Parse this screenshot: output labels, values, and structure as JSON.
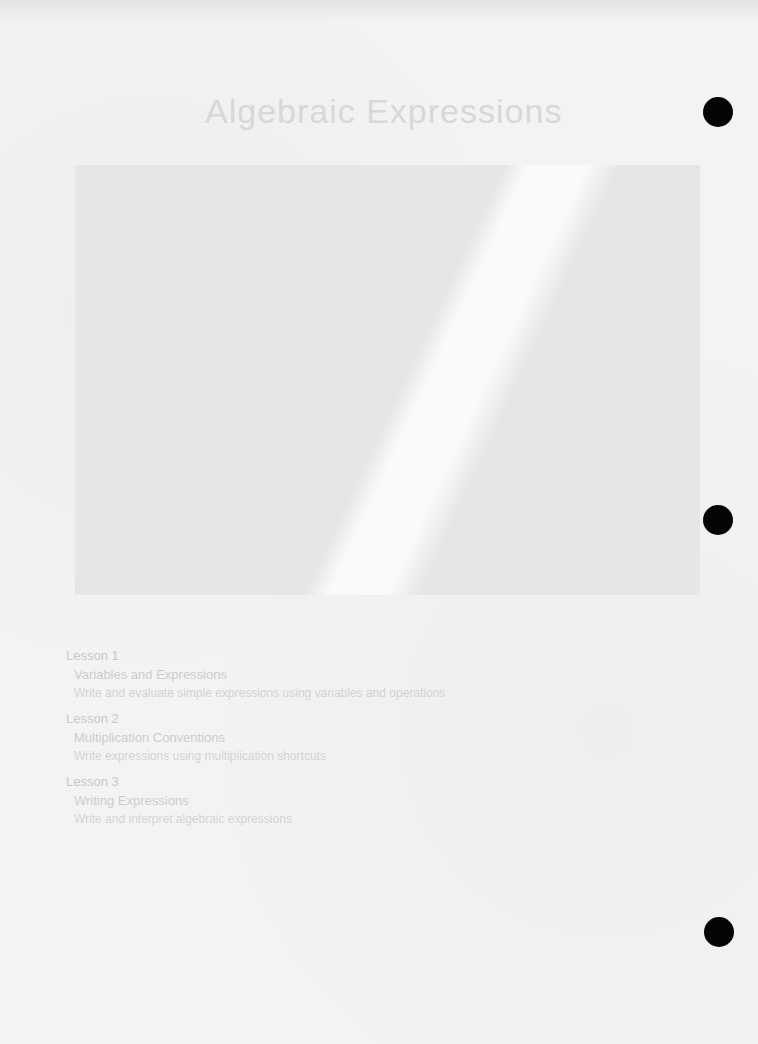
{
  "page": {
    "title": "Algebraic Expressions",
    "background_color": "#f3f3f3",
    "hole_color": "#050505"
  },
  "lessons": [
    {
      "heading": "Lesson 1",
      "title": "Variables and Expressions",
      "description": "Write and evaluate simple expressions using variables and operations"
    },
    {
      "heading": "Lesson 2",
      "title": "Multiplication Conventions",
      "description": "Write expressions using multiplication shortcuts"
    },
    {
      "heading": "Lesson 3",
      "title": "Writing Expressions",
      "description": "Write and interpret algebraic expressions"
    }
  ],
  "binder_holes": [
    "hole-top",
    "hole-middle",
    "hole-bottom"
  ]
}
